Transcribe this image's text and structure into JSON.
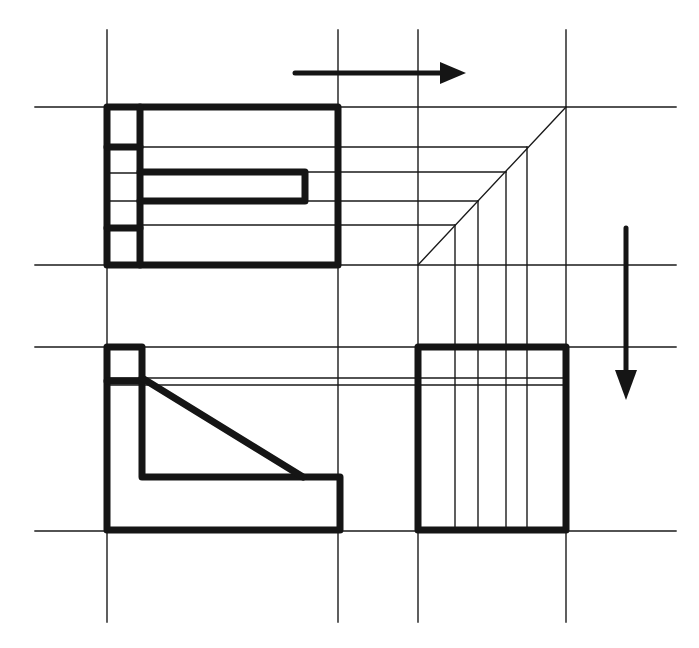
{
  "diagram": {
    "type": "orthographic-projection",
    "colors": {
      "line": "#1a1a1a",
      "background": "#ffffff"
    },
    "views": [
      {
        "name": "top-view",
        "position": "upper-left"
      },
      {
        "name": "front-view",
        "position": "lower-left"
      },
      {
        "name": "side-view",
        "position": "lower-right"
      },
      {
        "name": "miter-construction",
        "position": "upper-right"
      }
    ],
    "arrows": [
      {
        "name": "projection-arrow-right",
        "direction": "right"
      },
      {
        "name": "projection-arrow-down",
        "direction": "down"
      }
    ],
    "grid": {
      "vertical_lines_x": [
        107,
        338,
        418,
        566
      ],
      "horizontal_lines_y": [
        107,
        265,
        347,
        531
      ]
    },
    "labels": []
  }
}
